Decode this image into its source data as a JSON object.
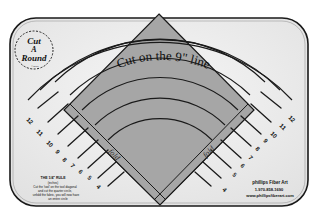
{
  "product": {
    "name": "Cut A Round ruler",
    "logo": {
      "line1": "Cut",
      "line2": "A",
      "line3": "Round",
      "small": "©2016"
    },
    "center_label": "Cut on the 9\" line",
    "fold_label_left": "fold",
    "fold_label_right": "fold",
    "left_numbers": [
      "12",
      "11",
      "10",
      "9",
      "8",
      "7",
      "6",
      "5",
      "4"
    ],
    "right_numbers": [
      "12",
      "11",
      "10",
      "9",
      "8",
      "7",
      "6",
      "5",
      "4"
    ],
    "instructions": {
      "title": "THE 1/4\" RULE",
      "line1": "(inches)",
      "line2": "Cut the 'tool' on the tool diagonal",
      "line3": "and cut the quarter circle,",
      "line4": "unfold the fabric, you will now have",
      "line5": "an entire circle"
    },
    "maker": {
      "name": "phillips Fiber Art",
      "phone": "1-970-858-1690",
      "website": "www.phillipsfiberart.com"
    }
  },
  "colors": {
    "ruler_face": "#ececec",
    "ruler_border": "#1a1a1a",
    "diamond_fill": "#a9a9a9",
    "band_fill": "#c4c4c4",
    "ink": "#111111"
  }
}
